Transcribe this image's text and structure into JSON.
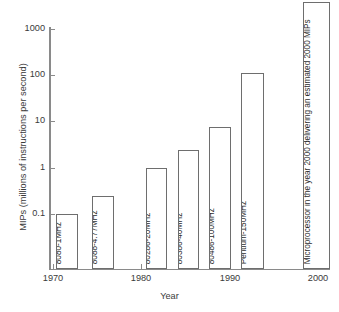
{
  "chart_data": {
    "type": "bar",
    "title": "",
    "xlabel": "Year",
    "ylabel": "MIPs (millions of instructions per second)",
    "yscale": "log",
    "ylim": [
      0.03,
      3000
    ],
    "xlim": [
      1970,
      2001
    ],
    "grid": false,
    "legend": null,
    "ytick_labels": [
      "1000",
      "100",
      "10",
      "1",
      "0.1"
    ],
    "ytick_values": [
      1000,
      100,
      10,
      1,
      0.1
    ],
    "xtick_labels": [
      "1970",
      "1980",
      "1990",
      "2000"
    ],
    "xtick_values": [
      1970,
      1980,
      1990,
      2000
    ],
    "categories": [
      "8080-1MHz",
      "8088-4.77MHz",
      "80286-20MHz",
      "80386-40MHz",
      "80486-100MHz",
      "Pentium-150MHz",
      "Microprocessor in the year 2000 delivering an estimated 2000 MIPs"
    ],
    "values": [
      0.1,
      0.37,
      1.0,
      2.4,
      15,
      112,
      2000
    ],
    "bars": [
      {
        "label": "8080-1MHz",
        "year": 1972,
        "value": 0.1,
        "left": 56,
        "width": 22,
        "top": 214
      },
      {
        "label": "8088-4.77MHz",
        "year": 1976,
        "value": 0.37,
        "left": 92,
        "width": 22,
        "top": 196
      },
      {
        "label": "80286-20MHz",
        "year": 1982,
        "value": 1.0,
        "left": 146,
        "width": 21,
        "top": 168
      },
      {
        "label": "80386-40MHz",
        "year": 1985,
        "value": 2.4,
        "left": 178,
        "width": 21,
        "top": 150
      },
      {
        "label": "80486-100MHz",
        "year": 1988,
        "value": 15,
        "left": 209,
        "width": 22,
        "top": 127
      },
      {
        "label": "Pentium-150MHz",
        "year": 1993,
        "value": 112,
        "left": 241,
        "width": 23,
        "top": 73
      },
      {
        "label": "Microprocessor in the year 2000 delivering an estimated 2000 MIPs",
        "year": 2000,
        "value": 2000,
        "left": 303,
        "width": 27,
        "top": 2
      }
    ]
  },
  "axes": {
    "y_ticks": [
      {
        "label": "1000",
        "y": 29
      },
      {
        "label": "100",
        "y": 75
      },
      {
        "label": "10",
        "y": 121
      },
      {
        "label": "1",
        "y": 168
      },
      {
        "label": "0.1",
        "y": 214
      }
    ],
    "x_ticks": [
      {
        "label": "1970",
        "x": 53
      },
      {
        "label": "1980",
        "x": 141
      },
      {
        "label": "1990",
        "x": 230
      },
      {
        "label": "2000",
        "x": 318
      }
    ],
    "x_title": "Year",
    "y_title": "MIPs (millions of instructions per second)"
  },
  "colors": {
    "background": "#ffffff",
    "axis": "#8a8a8a",
    "bar_outline": "#6e6e6e",
    "bar_fill": "#ffffff",
    "text": "#2e2e2e"
  }
}
